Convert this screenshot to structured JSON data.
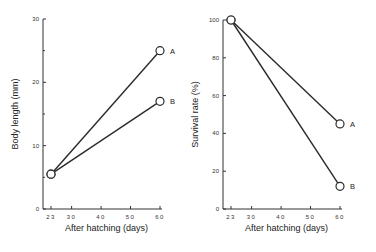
{
  "chart_data": [
    {
      "type": "line",
      "title": "",
      "xlabel": "After hatching (days)",
      "ylabel": "Body length (mm)",
      "x": [
        23,
        60
      ],
      "x_ticks": [
        23,
        30,
        40,
        50,
        60
      ],
      "y_ticks": [
        0,
        10,
        20,
        30
      ],
      "ylim": [
        0,
        30
      ],
      "grid": false,
      "legend": "inline labels at line ends",
      "series": [
        {
          "name": "A",
          "values": [
            5.5,
            25
          ]
        },
        {
          "name": "B",
          "values": [
            5.5,
            17
          ]
        }
      ]
    },
    {
      "type": "line",
      "title": "",
      "xlabel": "After hatching (days)",
      "ylabel": "Survival rate (%)",
      "x": [
        23,
        60
      ],
      "x_ticks": [
        23,
        30,
        40,
        50,
        60
      ],
      "y_ticks": [
        0,
        20,
        40,
        60,
        80,
        100
      ],
      "ylim": [
        0,
        100
      ],
      "grid": false,
      "legend": "inline labels at line ends",
      "series": [
        {
          "name": "A",
          "values": [
            100,
            45
          ]
        },
        {
          "name": "B",
          "values": [
            100,
            12
          ]
        }
      ]
    }
  ]
}
